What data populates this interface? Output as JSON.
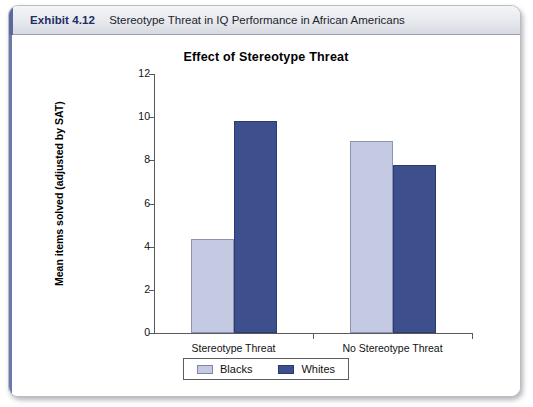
{
  "exhibit": {
    "number": "Exhibit 4.12",
    "title": "Stereotype Threat in IQ Performance in African Americans",
    "accent_color": "#5a6a9e"
  },
  "chart_data": {
    "type": "bar",
    "title": "Effect of Stereotype Threat",
    "xlabel": "",
    "ylabel": "Mean items solved (adjusted by SAT)",
    "categories": [
      "Stereotype Threat",
      "No Stereotype Threat"
    ],
    "series": [
      {
        "name": "Blacks",
        "color": "#c3cae2",
        "values": [
          4.35,
          8.9
        ]
      },
      {
        "name": "Whites",
        "color": "#3d4f8c",
        "values": [
          9.8,
          7.8
        ]
      }
    ],
    "ylim": [
      0,
      12
    ],
    "yticks": [
      0,
      2,
      4,
      6,
      8,
      10,
      12
    ],
    "ytick_labels": [
      "0",
      "2",
      "4",
      "6",
      "8",
      "10",
      "12"
    ],
    "grid": false,
    "legend_position": "bottom"
  }
}
